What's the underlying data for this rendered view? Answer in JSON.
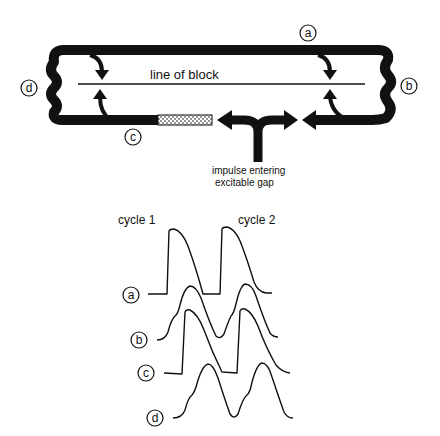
{
  "diagram": {
    "line_of_block_label": "line of block",
    "impulse_label_line1": "impulse entering",
    "impulse_label_line2": "excitable gap",
    "site_labels": {
      "a": "a",
      "b": "b",
      "c": "c",
      "d": "d"
    },
    "colors": {
      "ink": "#111111",
      "background": "#ffffff"
    }
  },
  "waveforms": {
    "cycle_labels": [
      "cycle 1",
      "cycle 2"
    ],
    "traces": [
      {
        "label": "a",
        "description": "action potential, sharp upstroke, two cycles"
      },
      {
        "label": "b",
        "description": "rounded waveform with shoulder, two cycles"
      },
      {
        "label": "c",
        "description": "action potential, sharp upstroke, two cycles"
      },
      {
        "label": "d",
        "description": "rounded waveform with shoulder, two cycles"
      }
    ]
  }
}
